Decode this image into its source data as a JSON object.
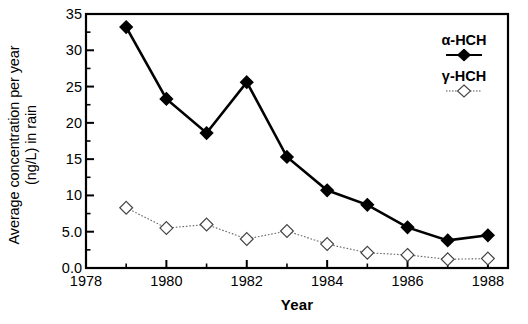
{
  "chart_data": {
    "type": "line",
    "title": "",
    "xlabel": "Year",
    "ylabel": "Average concentration per year (ng/L) in rain",
    "ylabel_line1": "Average concentration per year",
    "ylabel_line2": "(ng/L) in rain",
    "x": [
      1979,
      1980,
      1981,
      1982,
      1983,
      1984,
      1985,
      1986,
      1987,
      1988
    ],
    "xlim": [
      1978,
      1988.5
    ],
    "ylim": [
      0,
      35
    ],
    "xticks": [
      1978,
      1980,
      1982,
      1984,
      1986,
      1988
    ],
    "xtick_labels": [
      "1978",
      "1980",
      "1982",
      "1984",
      "1986",
      "1988"
    ],
    "xminor_ticks": [
      1979,
      1981,
      1983,
      1985,
      1987
    ],
    "yticks": [
      0,
      5,
      10,
      15,
      20,
      25,
      30,
      35
    ],
    "ytick_labels": [
      "0.0",
      "5.0",
      "10",
      "15",
      "20",
      "25",
      "30",
      "35"
    ],
    "yminor_ticks": [
      2.5,
      7.5,
      12.5,
      17.5,
      22.5,
      27.5,
      32.5
    ],
    "grid": false,
    "legend_position": "top-right inside",
    "series": [
      {
        "name": "α-HCH",
        "marker": "filled-diamond",
        "line_style": "solid",
        "color": "#000000",
        "values": [
          33.2,
          23.3,
          18.6,
          25.6,
          15.3,
          10.7,
          8.7,
          5.6,
          3.8,
          4.5
        ]
      },
      {
        "name": "γ-HCH",
        "marker": "open-diamond",
        "line_style": "dotted",
        "color": "#000000",
        "values": [
          8.3,
          5.5,
          6.0,
          4.0,
          5.1,
          3.3,
          2.1,
          1.8,
          1.2,
          1.3
        ]
      }
    ]
  },
  "legend": {
    "entries": [
      {
        "label": "α-HCH"
      },
      {
        "label": "γ-HCH"
      }
    ]
  }
}
